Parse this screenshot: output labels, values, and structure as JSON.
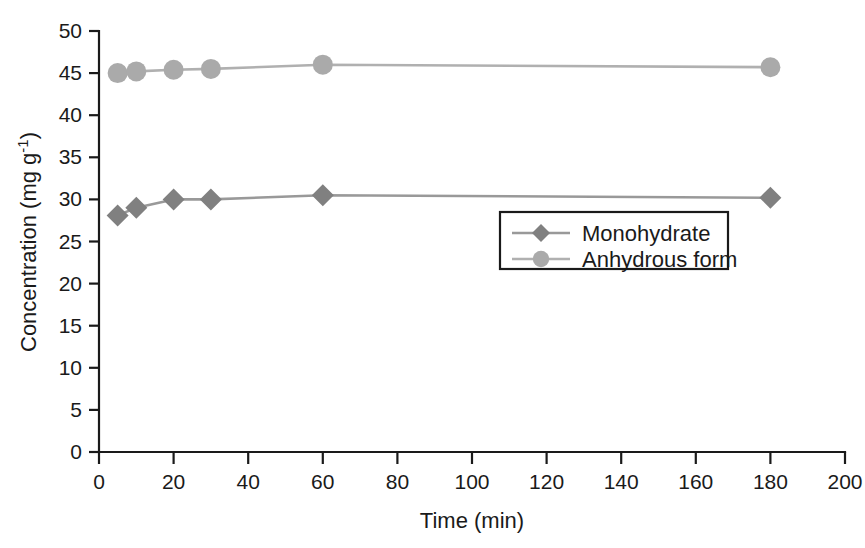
{
  "chart_data": {
    "type": "line",
    "title": "",
    "subtitle": "",
    "xlabel": "Time (min)",
    "ylabel": "Concentration (mg g⁻¹)",
    "xlim": [
      0,
      200
    ],
    "ylim": [
      0,
      50
    ],
    "xticks": [
      0,
      20,
      40,
      60,
      80,
      100,
      120,
      140,
      160,
      180,
      200
    ],
    "xtick_labels": [
      "0",
      "20",
      "40",
      "60",
      "80",
      "100",
      "120",
      "140",
      "160",
      "180",
      "200"
    ],
    "yticks": [
      0,
      5,
      10,
      15,
      20,
      25,
      30,
      35,
      40,
      45,
      50
    ],
    "ytick_labels": [
      "0",
      "5",
      "10",
      "15",
      "20",
      "25",
      "30",
      "35",
      "40",
      "45",
      "50"
    ],
    "grid": false,
    "legend_position": "center-right",
    "series": [
      {
        "name": "Monohydrate",
        "marker": "diamond",
        "color": "#808080",
        "line_color": "#999999",
        "x": [
          5,
          10,
          20,
          30,
          60,
          180
        ],
        "values": [
          28.1,
          29.0,
          30.0,
          30.0,
          30.5,
          30.2
        ]
      },
      {
        "name": "Anhydrous form",
        "marker": "circle",
        "color": "#aaaaaa",
        "line_color": "#b0b0b0",
        "x": [
          5,
          10,
          20,
          30,
          60,
          180
        ],
        "values": [
          45.0,
          45.2,
          45.4,
          45.5,
          46.0,
          45.7
        ]
      }
    ],
    "annotations": []
  },
  "legend": {
    "entries": [
      {
        "label": "Monohydrate"
      },
      {
        "label": "Anhydrous form"
      }
    ]
  }
}
